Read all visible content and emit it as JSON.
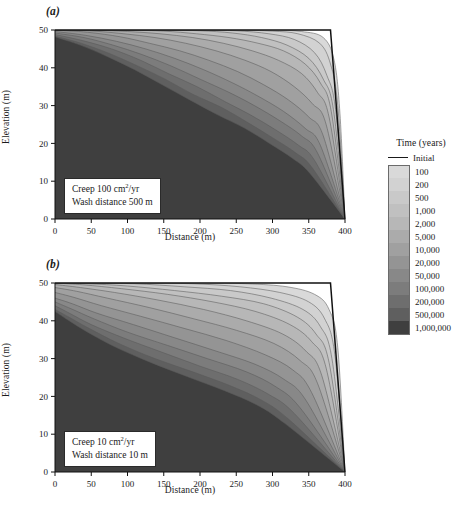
{
  "figure": {
    "panels": [
      {
        "id": "a",
        "label": "(a)",
        "annotation": {
          "line1_pre": "Creep 100 cm",
          "line1_sup": "2",
          "line1_post": "/yr",
          "line2": "Wash distance 500 m"
        }
      },
      {
        "id": "b",
        "label": "(b)",
        "annotation": {
          "line1_pre": "Creep 10 cm",
          "line1_sup": "2",
          "line1_post": "/yr",
          "line2": "Wash distance 10 m"
        }
      }
    ],
    "axes": {
      "xlabel": "Distance (m)",
      "ylabel": "Elevation (m)",
      "xticks": [
        0,
        50,
        100,
        150,
        200,
        250,
        300,
        350,
        400
      ],
      "yticks": [
        0,
        10,
        20,
        30,
        40,
        50
      ],
      "xlim": [
        0,
        400
      ],
      "ylim": [
        0,
        50
      ]
    },
    "legend": {
      "title": "Time (years)",
      "initial_label": "Initial",
      "initial_color": "#1a1a1a",
      "entries": [
        {
          "label": "100",
          "color": "#d9d9d9"
        },
        {
          "label": "200",
          "color": "#d2d2d2"
        },
        {
          "label": "500",
          "color": "#c9c9c9"
        },
        {
          "label": "1,000",
          "color": "#c0c0c0"
        },
        {
          "label": "2,000",
          "color": "#b7b7b7"
        },
        {
          "label": "5,000",
          "color": "#ababab"
        },
        {
          "label": "10,000",
          "color": "#a0a0a0"
        },
        {
          "label": "20,000",
          "color": "#949494"
        },
        {
          "label": "50,000",
          "color": "#888888"
        },
        {
          "label": "100,000",
          "color": "#7c7c7c"
        },
        {
          "label": "200,000",
          "color": "#6e6e6e"
        },
        {
          "label": "500,000",
          "color": "#5f5f5f"
        },
        {
          "label": "1,000,000",
          "color": "#3f3f3f"
        }
      ]
    }
  },
  "chart_data": {
    "type": "area",
    "xlabel": "Distance (m)",
    "ylabel": "Elevation (m)",
    "xlim": [
      0,
      400
    ],
    "ylim": [
      0,
      50
    ],
    "xticks": [
      0,
      50,
      100,
      150,
      200,
      250,
      300,
      350,
      400
    ],
    "yticks": [
      0,
      10,
      20,
      30,
      40,
      50
    ],
    "grid": false,
    "legend_position": "right",
    "legend_title": "Time (years)",
    "colors": [
      "#d9d9d9",
      "#d2d2d2",
      "#c9c9c9",
      "#c0c0c0",
      "#b7b7b7",
      "#ababab",
      "#a0a0a0",
      "#949494",
      "#888888",
      "#7c7c7c",
      "#6e6e6e",
      "#5f5f5f",
      "#3f3f3f"
    ],
    "panels": [
      {
        "id": "a",
        "label": "(a)",
        "creep_coefficient_cm2_per_yr": 100,
        "wash_distance_m": 500,
        "initial_profile": [
          [
            0,
            50
          ],
          [
            380,
            50
          ],
          [
            400,
            0
          ]
        ],
        "series": [
          {
            "name": "100",
            "x": [
              0,
              50,
              100,
              150,
              200,
              250,
              300,
              340,
              370,
              385,
              393,
              400
            ],
            "y": [
              50,
              50,
              50,
              50,
              50,
              50,
              50,
              49.6,
              48,
              42,
              28,
              0
            ]
          },
          {
            "name": "200",
            "x": [
              0,
              50,
              100,
              150,
              200,
              250,
              300,
              335,
              365,
              380,
              390,
              400
            ],
            "y": [
              50,
              50,
              50,
              50,
              50,
              50,
              49.7,
              49,
              46.5,
              41,
              30,
              0
            ]
          },
          {
            "name": "500",
            "x": [
              0,
              50,
              100,
              150,
              200,
              250,
              295,
              330,
              358,
              375,
              387,
              400
            ],
            "y": [
              50,
              50,
              50,
              50,
              50,
              49.8,
              49,
              47.5,
              44,
              38,
              29,
              0
            ]
          },
          {
            "name": "1,000",
            "x": [
              0,
              50,
              100,
              150,
              200,
              245,
              285,
              320,
              350,
              370,
              384,
              400
            ],
            "y": [
              50,
              50,
              50,
              50,
              49.8,
              49.2,
              48,
              46,
              42.5,
              37,
              29,
              0
            ]
          },
          {
            "name": "2,000",
            "x": [
              0,
              50,
              100,
              150,
              195,
              240,
              280,
              315,
              345,
              366,
              381,
              400
            ],
            "y": [
              50,
              50,
              50,
              49.7,
              49,
              48,
              46.5,
              44.5,
              41,
              36,
              28.5,
              0
            ]
          },
          {
            "name": "5,000",
            "x": [
              0,
              50,
              100,
              145,
              190,
              232,
              272,
              308,
              340,
              362,
              378,
              400
            ],
            "y": [
              50,
              50,
              49.6,
              49,
              48,
              46.5,
              44.5,
              42,
              38.5,
              33.5,
              27,
              0
            ]
          },
          {
            "name": "10,000",
            "x": [
              0,
              48,
              95,
              138,
              180,
              222,
              262,
              298,
              330,
              355,
              374,
              400
            ],
            "y": [
              50,
              49.8,
              49,
              48,
              46.5,
              44.5,
              42,
              39,
              35,
              30.5,
              25,
              0
            ]
          },
          {
            "name": "20,000",
            "x": [
              0,
              45,
              90,
              130,
              172,
              212,
              252,
              288,
              322,
              350,
              370,
              400
            ],
            "y": [
              50,
              49.4,
              48.2,
              46.5,
              44.5,
              42,
              39,
              35.5,
              31.5,
              27,
              22,
              0
            ]
          },
          {
            "name": "50,000",
            "x": [
              0,
              42,
              85,
              125,
              165,
              205,
              245,
              280,
              315,
              345,
              366,
              400
            ],
            "y": [
              49.6,
              48.6,
              47,
              45,
              42.5,
              39.5,
              36,
              32.5,
              28.5,
              24,
              19.5,
              0
            ]
          },
          {
            "name": "100,000",
            "x": [
              0,
              40,
              80,
              120,
              160,
              200,
              240,
              275,
              310,
              340,
              362,
              400
            ],
            "y": [
              49.2,
              48,
              46,
              43.5,
              40.5,
              37,
              33.5,
              30,
              26,
              22,
              17.5,
              0
            ]
          },
          {
            "name": "200,000",
            "x": [
              0,
              38,
              78,
              118,
              156,
              196,
              235,
              270,
              305,
              336,
              358,
              400
            ],
            "y": [
              48.8,
              47.2,
              45,
              42,
              38.5,
              35,
              31,
              27.5,
              23.5,
              19.5,
              15.5,
              0
            ]
          },
          {
            "name": "500,000",
            "x": [
              0,
              36,
              75,
              114,
              152,
              190,
              230,
              266,
              300,
              332,
              355,
              400
            ],
            "y": [
              48.4,
              46.5,
              43.8,
              40.5,
              37,
              33,
              29.5,
              25.5,
              21.5,
              17.5,
              13.5,
              0
            ]
          },
          {
            "name": "1,000,000",
            "x": [
              0,
              35,
              72,
              110,
              148,
              186,
              225,
              262,
              296,
              328,
              352,
              400
            ],
            "y": [
              48.2,
              46,
              43,
              39.5,
              35.5,
              31.5,
              27.5,
              24,
              20,
              16,
              12,
              0
            ]
          }
        ]
      },
      {
        "id": "b",
        "label": "(b)",
        "creep_coefficient_cm2_per_yr": 10,
        "wash_distance_m": 10,
        "initial_profile": [
          [
            0,
            50
          ],
          [
            380,
            50
          ],
          [
            400,
            0
          ]
        ],
        "series": [
          {
            "name": "100",
            "x": [
              0,
              60,
              130,
              200,
              265,
              320,
              358,
              378,
              390,
              400
            ],
            "y": [
              50,
              50,
              50,
              50,
              49.8,
              49,
              47,
              43,
              33,
              0
            ]
          },
          {
            "name": "200",
            "x": [
              0,
              55,
              120,
              190,
              255,
              310,
              350,
              372,
              386,
              400
            ],
            "y": [
              50,
              50,
              50,
              49.8,
              49,
              47.5,
              45,
              40.5,
              31,
              0
            ]
          },
          {
            "name": "500",
            "x": [
              0,
              50,
              110,
              178,
              242,
              298,
              342,
              366,
              382,
              400
            ],
            "y": [
              50,
              50,
              49.8,
              49,
              48,
              46,
              43,
              38.5,
              30,
              0
            ]
          },
          {
            "name": "1,000",
            "x": [
              0,
              45,
              100,
              165,
              230,
              288,
              334,
              360,
              378,
              400
            ],
            "y": [
              50,
              49.8,
              49.2,
              48,
              46.5,
              44.5,
              41,
              36.5,
              29,
              0
            ]
          },
          {
            "name": "2,000",
            "x": [
              0,
              40,
              92,
              155,
              218,
              276,
              324,
              354,
              374,
              400
            ],
            "y": [
              50,
              49.5,
              48.5,
              47,
              45,
              42.5,
              39,
              34.5,
              27.5,
              0
            ]
          },
          {
            "name": "5,000",
            "x": [
              0,
              35,
              82,
              142,
              205,
              264,
              314,
              346,
              368,
              400
            ],
            "y": [
              49.6,
              48.8,
              47.5,
              45.5,
              43,
              40,
              36.5,
              32,
              25.5,
              0
            ]
          },
          {
            "name": "10,000",
            "x": [
              0,
              30,
              72,
              130,
              192,
              250,
              302,
              338,
              362,
              400
            ],
            "y": [
              48.8,
              47.8,
              46,
              43.5,
              40.5,
              37.5,
              34,
              29.5,
              23.5,
              0
            ]
          },
          {
            "name": "20,000",
            "x": [
              0,
              26,
              64,
              118,
              178,
              236,
              290,
              328,
              354,
              400
            ],
            "y": [
              47.5,
              46.2,
              44,
              41.2,
              38,
              34.8,
              31,
              27,
              21,
              0
            ]
          },
          {
            "name": "50,000",
            "x": [
              0,
              24,
              58,
              108,
              165,
              222,
              276,
              316,
              346,
              400
            ],
            "y": [
              46,
              44.5,
              42,
              39,
              35.5,
              32,
              28.5,
              24.5,
              19,
              0
            ]
          },
          {
            "name": "100,000",
            "x": [
              0,
              22,
              54,
              100,
              155,
              210,
              264,
              305,
              338,
              400
            ],
            "y": [
              45,
              43.2,
              40.5,
              37,
              33.5,
              30,
              26.5,
              22.5,
              17,
              0
            ]
          },
          {
            "name": "200,000",
            "x": [
              0,
              20,
              50,
              94,
              146,
              200,
              252,
              295,
              330,
              400
            ],
            "y": [
              44,
              42,
              39,
              35.5,
              31.8,
              28,
              24.5,
              20.5,
              15.5,
              0
            ]
          },
          {
            "name": "500,000",
            "x": [
              0,
              19,
              47,
              88,
              138,
              190,
              242,
              285,
              322,
              400
            ],
            "y": [
              43,
              41,
              38,
              34,
              30,
              26.5,
              22.8,
              19,
              14,
              0
            ]
          },
          {
            "name": "1,000,000",
            "x": [
              0,
              18,
              45,
              84,
              132,
              183,
              234,
              278,
              316,
              400
            ],
            "y": [
              42.5,
              40.2,
              37,
              33,
              29,
              25.2,
              21.5,
              17.8,
              13,
              0
            ]
          }
        ]
      }
    ]
  }
}
